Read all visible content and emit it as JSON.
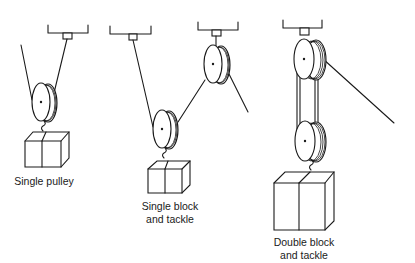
{
  "diagram": {
    "type": "pulley-systems-illustration",
    "stroke_color": "#1a1a1a",
    "background": "#ffffff",
    "figures": [
      {
        "id": "single-pulley",
        "label": "Single pulley",
        "label_lines": [
          "Single pulley"
        ],
        "pulleys": 1,
        "mounts": 1
      },
      {
        "id": "single-block-and-tackle",
        "label": "Single block and tackle",
        "label_lines": [
          "Single block",
          "and tackle"
        ],
        "pulleys": 2,
        "mounts": 2
      },
      {
        "id": "double-block-and-tackle",
        "label": "Double block and tackle",
        "label_lines": [
          "Double block",
          "and tackle"
        ],
        "pulleys": 2,
        "mounts": 1
      }
    ]
  }
}
